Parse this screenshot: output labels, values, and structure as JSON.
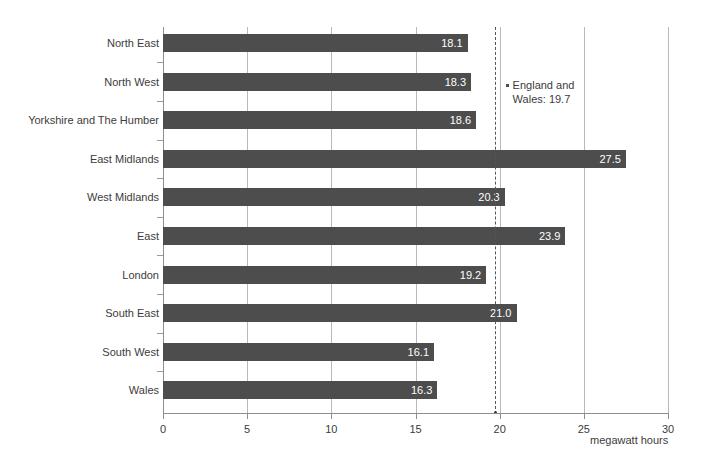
{
  "chart_data": {
    "type": "bar",
    "orientation": "horizontal",
    "title": "",
    "subtitle": "",
    "xlabel": "megawatt hours",
    "ylabel": "",
    "xlim": [
      0,
      30
    ],
    "xticks": [
      0,
      5,
      10,
      15,
      20,
      25,
      30
    ],
    "xtick_labels": [
      "0",
      "5",
      "10",
      "15",
      "20",
      "25",
      "30"
    ],
    "grid": true,
    "grid_axis": "x",
    "legend": false,
    "bar_color": "#4d4d4d",
    "value_label_color": "#ffffff",
    "categories": [
      "North East",
      "North West",
      "Yorkshire and The Humber",
      "East Midlands",
      "West Midlands",
      "East",
      "London",
      "South East",
      "South West",
      "Wales"
    ],
    "values": [
      18.1,
      18.3,
      18.6,
      27.5,
      20.3,
      23.9,
      19.2,
      21.0,
      16.1,
      16.3
    ],
    "value_labels": [
      "18.1",
      "18.3",
      "18.6",
      "27.5",
      "20.3",
      "23.9",
      "19.2",
      "21.0",
      "16.1",
      "16.3"
    ],
    "reference_line": {
      "value": 19.7,
      "label_line1": "England and",
      "label_line2": "Wales: 19.7",
      "style": "dashed",
      "color": "#555555"
    }
  }
}
